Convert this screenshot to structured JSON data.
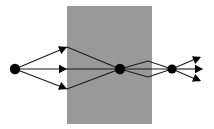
{
  "figure": {
    "type": "optics-ray-diagram",
    "title": "",
    "width": 214,
    "height": 129,
    "background_color": "#ffffff"
  },
  "colors": {
    "background": "#ffffff",
    "slab_fill": "#999999",
    "ray_stroke": "#1a1a1a",
    "node_fill": "#000000",
    "arrow_fill": "#000000"
  },
  "medium": {
    "label": "",
    "shape": "rectangle",
    "fill": "#999999",
    "x": 67,
    "y": 6,
    "width": 85,
    "height": 118
  },
  "nodes": [
    {
      "name": "source-point",
      "label": "",
      "x": 15,
      "y": 69,
      "r": 5.2
    },
    {
      "name": "focus-point-center",
      "label": "",
      "x": 120,
      "y": 69,
      "r": 5.2
    },
    {
      "name": "focus-point-right",
      "label": "",
      "x": 172,
      "y": 69,
      "r": 4.6
    }
  ],
  "rays": [
    {
      "name": "ray-upper-incident",
      "points": [
        [
          15,
          69
        ],
        [
          67,
          47
        ]
      ]
    },
    {
      "name": "ray-axis-incident",
      "points": [
        [
          15,
          69
        ],
        [
          67,
          69
        ]
      ]
    },
    {
      "name": "ray-lower-incident",
      "points": [
        [
          15,
          69
        ],
        [
          67,
          89
        ]
      ]
    },
    {
      "name": "ray-upper-inside",
      "points": [
        [
          67,
          47
        ],
        [
          120,
          69
        ]
      ]
    },
    {
      "name": "ray-axis-inside",
      "points": [
        [
          67,
          69
        ],
        [
          120,
          69
        ]
      ]
    },
    {
      "name": "ray-lower-inside",
      "points": [
        [
          67,
          89
        ],
        [
          120,
          69
        ]
      ]
    },
    {
      "name": "ray-upper-exit",
      "points": [
        [
          120,
          69
        ],
        [
          148,
          61
        ],
        [
          172,
          69
        ]
      ]
    },
    {
      "name": "ray-axis-exit",
      "points": [
        [
          120,
          69
        ],
        [
          172,
          69
        ]
      ]
    },
    {
      "name": "ray-lower-exit",
      "points": [
        [
          120,
          69
        ],
        [
          148,
          77
        ],
        [
          172,
          69
        ]
      ]
    },
    {
      "name": "ray-upper-outgoing",
      "points": [
        [
          172,
          69
        ],
        [
          200,
          57
        ]
      ]
    },
    {
      "name": "ray-axis-outgoing",
      "points": [
        [
          172,
          69
        ],
        [
          202,
          69
        ]
      ]
    },
    {
      "name": "ray-lower-outgoing",
      "points": [
        [
          172,
          69
        ],
        [
          200,
          81
        ]
      ]
    }
  ],
  "arrowheads": [
    {
      "name": "arrowhead-upper-entry",
      "x": 67,
      "y": 47,
      "angle": -23,
      "size": 8
    },
    {
      "name": "arrowhead-axis-entry",
      "x": 67,
      "y": 69,
      "angle": 0,
      "size": 8
    },
    {
      "name": "arrowhead-lower-entry",
      "x": 67,
      "y": 89,
      "angle": 23,
      "size": 8
    },
    {
      "name": "arrowhead-upper-exit",
      "x": 201,
      "y": 57,
      "angle": -23,
      "size": 8
    },
    {
      "name": "arrowhead-axis-exit",
      "x": 203,
      "y": 69,
      "angle": 0,
      "size": 8
    },
    {
      "name": "arrowhead-lower-exit",
      "x": 201,
      "y": 81,
      "angle": 23,
      "size": 8
    }
  ],
  "annotations": []
}
